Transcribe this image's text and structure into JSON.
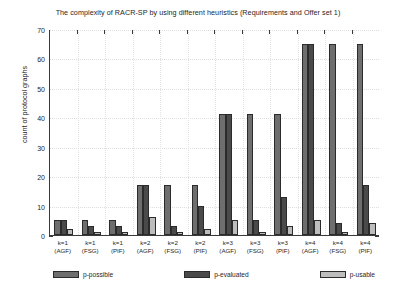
{
  "chart_data": {
    "type": "bar",
    "title": "The complexity of RACR-SP by using different heuristics (Requirements and Offer set 1)",
    "xlabel": "",
    "ylabel": "count of protocol graphs",
    "ylim": [
      0,
      70
    ],
    "yticks": [
      0,
      10,
      20,
      30,
      40,
      50,
      60,
      70
    ],
    "grid": true,
    "legend_position": "below-axes",
    "categories": [
      "k=1 (AGF)",
      "k=1 (FSG)",
      "k=1 (PIF)",
      "k=2 (AGF)",
      "k=2 (FSG)",
      "k=2 (PIF)",
      "k=3 (AGF)",
      "k=3 (FSG)",
      "k=3 (PIF)",
      "k=4 (AGF)",
      "k=4 (FSG)",
      "k=4 (PIF)"
    ],
    "category_lines": [
      [
        "k=1",
        "(AGF)"
      ],
      [
        "k=1",
        "(FSG)"
      ],
      [
        "k=1",
        "(PIF)"
      ],
      [
        "k=2",
        "(AGF)"
      ],
      [
        "k=2",
        "(FSG)"
      ],
      [
        "k=2",
        "(PIF)"
      ],
      [
        "k=3",
        "(AGF)"
      ],
      [
        "k=3",
        "(FSG)"
      ],
      [
        "k=3",
        "(PIF)"
      ],
      [
        "k=4",
        "(AGF)"
      ],
      [
        "k=4",
        "(FSG)"
      ],
      [
        "k=4",
        "(PIF)"
      ]
    ],
    "series": [
      {
        "name": "p-possible",
        "color": "#6e6e6e",
        "values": [
          5,
          5,
          5,
          17,
          17,
          17,
          41,
          41,
          41,
          65,
          65,
          65
        ]
      },
      {
        "name": "p-evaluated",
        "color": "#4a4a4a",
        "values": [
          5,
          3,
          3,
          17,
          3,
          10,
          41,
          5,
          13,
          65,
          4,
          17
        ]
      },
      {
        "name": "p-usable",
        "color": "#bdbdbd",
        "values": [
          2,
          1,
          1,
          6,
          1,
          2,
          5,
          1,
          3,
          5,
          1,
          4
        ]
      }
    ]
  },
  "legend": {
    "items": [
      {
        "label": "p-possible"
      },
      {
        "label": "p-evaluated"
      },
      {
        "label": "p-usable"
      }
    ]
  }
}
